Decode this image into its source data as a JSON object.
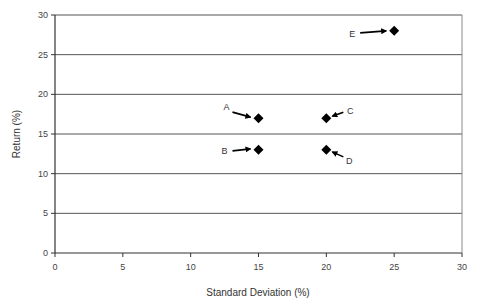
{
  "chart_data": {
    "type": "scatter",
    "title": "",
    "xlabel": "Standard Deviation (%)",
    "ylabel": "Return (%)",
    "xlim": [
      0,
      30
    ],
    "ylim": [
      0,
      30
    ],
    "xticks": [
      0,
      5,
      10,
      15,
      20,
      25,
      30
    ],
    "yticks": [
      0,
      5,
      10,
      15,
      20,
      25,
      30
    ],
    "grid": {
      "horizontal": true,
      "vertical": false
    },
    "legend": null,
    "marker": "diamond",
    "points": [
      {
        "label": "A",
        "x": 15,
        "y": 17,
        "label_side": "upper-left"
      },
      {
        "label": "B",
        "x": 15,
        "y": 13,
        "label_side": "left"
      },
      {
        "label": "C",
        "x": 20,
        "y": 17,
        "label_side": "upper-right"
      },
      {
        "label": "D",
        "x": 20,
        "y": 13,
        "label_side": "lower-right"
      },
      {
        "label": "E",
        "x": 25,
        "y": 28,
        "label_side": "left"
      }
    ]
  },
  "colors": {
    "marker": "#000000",
    "grid": "#555555",
    "axis": "#333333"
  }
}
